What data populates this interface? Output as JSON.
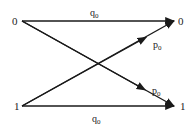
{
  "diagram": {
    "type": "binary-channel-transition",
    "nodes": {
      "left_top": "0",
      "left_bottom": "1",
      "right_top": "0",
      "right_bottom": "1"
    },
    "edges": [
      {
        "from": "left_top",
        "to": "right_top",
        "label": "q",
        "subscript": "0"
      },
      {
        "from": "left_top",
        "to": "right_bottom",
        "label": "p",
        "subscript": "0"
      },
      {
        "from": "left_bottom",
        "to": "right_top",
        "label": "p",
        "subscript": "0"
      },
      {
        "from": "left_bottom",
        "to": "right_bottom",
        "label": "q",
        "subscript": "0"
      }
    ],
    "color": "#1a1a1a"
  }
}
